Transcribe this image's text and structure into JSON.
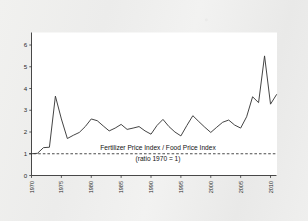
{
  "figure": {
    "background_color": "#eeeeed",
    "plot_background_color": "#ffffff",
    "line_color": "#3a3a3a",
    "axis_color": "#333333",
    "text_color": "#1a1a1a"
  },
  "annotations": {
    "line1": "Fertilizer Price Index / Food Price Index",
    "line2": "(ratio 1970 = 1)"
  },
  "chart_data": {
    "type": "line",
    "title": "",
    "subtitle": "",
    "xlabel": "",
    "ylabel": "",
    "xlim": [
      1970,
      2011
    ],
    "ylim": [
      0,
      6.3
    ],
    "grid": false,
    "legend": "none",
    "yticks": [
      0,
      1,
      2,
      3,
      4,
      5,
      6
    ],
    "ytick_labels": [
      "0",
      "1",
      "2",
      "3",
      "4",
      "5",
      "6"
    ],
    "xticks": [
      1970,
      1975,
      1980,
      1985,
      1990,
      1995,
      2000,
      2005,
      2010
    ],
    "xtick_labels": [
      "1970",
      "1975",
      "1980",
      "1985",
      "1990",
      "1995",
      "2000",
      "2005",
      "2010"
    ],
    "xtick_rotation": 90,
    "reference_line": {
      "y": 1,
      "style": "dashed",
      "label": "(ratio 1970 = 1)"
    },
    "series": [
      {
        "name": "Fertilizer Price Index / Food Price Index",
        "x": [
          1970,
          1971,
          1972,
          1973,
          1974,
          1975,
          1976,
          1977,
          1978,
          1979,
          1980,
          1981,
          1982,
          1983,
          1984,
          1985,
          1986,
          1987,
          1988,
          1989,
          1990,
          1991,
          1992,
          1993,
          1994,
          1995,
          1996,
          1997,
          1998,
          1999,
          2000,
          2001,
          2002,
          2003,
          2004,
          2005,
          2006,
          2007,
          2008,
          2009,
          2010,
          2011
        ],
        "values": [
          1.0,
          1.02,
          1.28,
          1.3,
          3.65,
          2.6,
          1.7,
          1.85,
          1.98,
          2.25,
          2.6,
          2.52,
          2.28,
          2.05,
          2.18,
          2.35,
          2.12,
          2.18,
          2.25,
          2.05,
          1.9,
          2.3,
          2.58,
          2.25,
          2.0,
          1.82,
          2.3,
          2.75,
          2.48,
          2.22,
          1.98,
          2.22,
          2.45,
          2.55,
          2.32,
          2.18,
          2.7,
          3.62,
          3.35,
          5.5,
          3.28,
          3.72
        ]
      }
    ]
  }
}
